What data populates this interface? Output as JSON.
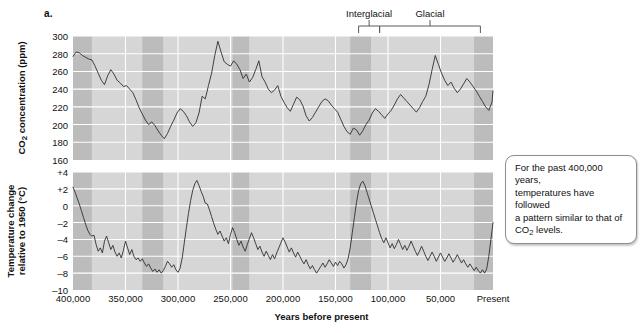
{
  "figure": {
    "panel_label": "a.",
    "xlabel": "Years before present",
    "callout": {
      "line1": "For the past 400,000 years,",
      "line2": "temperatures have followed",
      "line3": "a pattern similar to that of",
      "line4_pre": "CO",
      "line4_sub": "2",
      "line4_post": " levels."
    },
    "annotations": [
      {
        "label": "Interglacial",
        "x_start": 108000,
        "x_end": 128000
      },
      {
        "label": "Glacial",
        "x_start": 12000,
        "x_end": 108000
      }
    ],
    "colors": {
      "band_light": "#d6d6d6",
      "band_dark": "#bcbcbc",
      "gridline": "#ffffff",
      "curve": "#2f2f2f",
      "text": "#111111",
      "callout_border": "#8d8d8d"
    }
  },
  "chart_data": [
    {
      "type": "line",
      "name": "co2",
      "title": "",
      "xlabel": "Years before present",
      "ylabel": "CO2 concentration (ppm)",
      "ylabel_pre": "CO",
      "ylabel_sub": "2",
      "ylabel_post": " concentration (ppm)",
      "ylim": [
        160,
        300
      ],
      "yticks": [
        160,
        180,
        200,
        220,
        240,
        260,
        280,
        300
      ],
      "ytick_labels": [
        "160",
        "180",
        "200",
        "220",
        "240",
        "260",
        "280",
        "300"
      ],
      "xlim": [
        400000,
        0
      ],
      "xticks": [
        400000,
        350000,
        300000,
        250000,
        200000,
        150000,
        100000,
        50000,
        0
      ],
      "xtick_labels": [
        "400,000",
        "350,000",
        "300,000",
        "250,000",
        "200,000",
        "150,000",
        "100,000",
        "50,000",
        "Present"
      ],
      "grid": true,
      "legend": "none",
      "x": [
        400000,
        397000,
        394000,
        391000,
        388000,
        385000,
        382000,
        379000,
        376000,
        373000,
        370000,
        367000,
        364000,
        361000,
        358000,
        355000,
        352000,
        349000,
        346000,
        343000,
        340000,
        337000,
        334000,
        331000,
        328000,
        325000,
        322000,
        319000,
        316000,
        313000,
        310000,
        307000,
        304000,
        301000,
        298000,
        295000,
        292000,
        289000,
        286000,
        283000,
        280000,
        277000,
        274000,
        271000,
        268000,
        265000,
        262000,
        259000,
        256000,
        253000,
        250000,
        247000,
        244000,
        241000,
        238000,
        235000,
        232000,
        229000,
        226000,
        223000,
        220000,
        217000,
        214000,
        211000,
        208000,
        205000,
        202000,
        199000,
        196000,
        193000,
        190000,
        187000,
        184000,
        181000,
        178000,
        175000,
        172000,
        169000,
        166000,
        163000,
        160000,
        157000,
        154000,
        151000,
        148000,
        145000,
        142000,
        139000,
        136000,
        133000,
        130000,
        127000,
        124000,
        121000,
        118000,
        115000,
        112000,
        109000,
        106000,
        103000,
        100000,
        97000,
        94000,
        91000,
        88000,
        85000,
        82000,
        79000,
        76000,
        73000,
        70000,
        67000,
        64000,
        61000,
        58000,
        55000,
        52000,
        49000,
        46000,
        43000,
        40000,
        37000,
        34000,
        31000,
        28000,
        25000,
        22000,
        19000,
        16000,
        13000,
        10000,
        7000,
        4000,
        1000,
        0
      ],
      "y": [
        277,
        282,
        281,
        278,
        276,
        274,
        273,
        266,
        258,
        250,
        245,
        255,
        262,
        257,
        250,
        247,
        243,
        244,
        240,
        236,
        228,
        219,
        212,
        205,
        200,
        203,
        199,
        193,
        188,
        184,
        190,
        198,
        205,
        213,
        218,
        215,
        210,
        203,
        198,
        202,
        213,
        232,
        229,
        244,
        258,
        278,
        294,
        282,
        271,
        268,
        266,
        272,
        268,
        262,
        252,
        257,
        248,
        253,
        262,
        272,
        254,
        248,
        240,
        236,
        239,
        244,
        232,
        225,
        219,
        215,
        223,
        231,
        228,
        221,
        210,
        204,
        208,
        214,
        220,
        226,
        229,
        227,
        222,
        218,
        214,
        206,
        198,
        192,
        189,
        196,
        194,
        188,
        193,
        200,
        205,
        213,
        218,
        215,
        211,
        207,
        212,
        216,
        222,
        229,
        234,
        230,
        226,
        222,
        218,
        214,
        219,
        226,
        232,
        245,
        262,
        278,
        268,
        258,
        250,
        244,
        248,
        241,
        236,
        240,
        246,
        252,
        248,
        243,
        238,
        232,
        226,
        220,
        216,
        225,
        238,
        262,
        278,
        285,
        283
      ],
      "shaded_bands": [
        {
          "x_start": 400000,
          "x_end": 382000,
          "shade": "dark"
        },
        {
          "x_start": 382000,
          "x_end": 334000,
          "shade": "light"
        },
        {
          "x_start": 334000,
          "x_end": 314000,
          "shade": "dark"
        },
        {
          "x_start": 314000,
          "x_end": 248000,
          "shade": "light"
        },
        {
          "x_start": 248000,
          "x_end": 232000,
          "shade": "dark"
        },
        {
          "x_start": 232000,
          "x_end": 136000,
          "shade": "light"
        },
        {
          "x_start": 136000,
          "x_end": 116000,
          "shade": "dark"
        },
        {
          "x_start": 116000,
          "x_end": 18000,
          "shade": "light"
        },
        {
          "x_start": 18000,
          "x_end": 0,
          "shade": "dark"
        }
      ]
    },
    {
      "type": "line",
      "name": "temperature",
      "title": "",
      "xlabel": "Years before present",
      "ylabel": "Temperature change relative to 1950 (C)",
      "ylabel_line1": "Temperature change",
      "ylabel_line2": "relative to 1950 (°C)",
      "ylim": [
        -10,
        4
      ],
      "yticks": [
        -10,
        -8,
        -6,
        -4,
        -2,
        0,
        2,
        4
      ],
      "ytick_labels": [
        "–10",
        "–8",
        "–6",
        "–4",
        "–2",
        "0",
        "+2",
        "+4"
      ],
      "xlim": [
        400000,
        0
      ],
      "xticks": [
        400000,
        350000,
        300000,
        250000,
        200000,
        150000,
        100000,
        50000,
        0
      ],
      "xtick_labels": [
        "400,000",
        "350,000",
        "300,000",
        "250,000",
        "200,000",
        "150,000",
        "100,000",
        "50,000",
        "Present"
      ],
      "grid": true,
      "legend": "none",
      "x": [
        400000,
        398000,
        396000,
        394000,
        392000,
        390000,
        388000,
        386000,
        384000,
        382000,
        380000,
        378000,
        376000,
        374000,
        372000,
        370000,
        368000,
        366000,
        364000,
        362000,
        360000,
        358000,
        356000,
        354000,
        352000,
        350000,
        348000,
        346000,
        344000,
        342000,
        340000,
        338000,
        336000,
        334000,
        332000,
        330000,
        328000,
        326000,
        324000,
        322000,
        320000,
        318000,
        316000,
        314000,
        312000,
        310000,
        308000,
        306000,
        304000,
        302000,
        300000,
        298000,
        296000,
        294000,
        292000,
        290000,
        288000,
        286000,
        284000,
        282000,
        280000,
        278000,
        276000,
        274000,
        272000,
        270000,
        268000,
        266000,
        264000,
        262000,
        260000,
        258000,
        256000,
        254000,
        252000,
        250000,
        248000,
        246000,
        244000,
        242000,
        240000,
        238000,
        236000,
        234000,
        232000,
        230000,
        228000,
        226000,
        224000,
        222000,
        220000,
        218000,
        216000,
        214000,
        212000,
        210000,
        208000,
        206000,
        204000,
        202000,
        200000,
        198000,
        196000,
        194000,
        192000,
        190000,
        188000,
        186000,
        184000,
        182000,
        180000,
        178000,
        176000,
        174000,
        172000,
        170000,
        168000,
        166000,
        164000,
        162000,
        160000,
        158000,
        156000,
        154000,
        152000,
        150000,
        148000,
        146000,
        144000,
        142000,
        140000,
        138000,
        136000,
        134000,
        132000,
        130000,
        128000,
        126000,
        124000,
        122000,
        120000,
        118000,
        116000,
        114000,
        112000,
        110000,
        108000,
        106000,
        104000,
        102000,
        100000,
        98000,
        96000,
        94000,
        92000,
        90000,
        88000,
        86000,
        84000,
        82000,
        80000,
        78000,
        76000,
        74000,
        72000,
        70000,
        68000,
        66000,
        64000,
        62000,
        60000,
        58000,
        56000,
        54000,
        52000,
        50000,
        48000,
        46000,
        44000,
        42000,
        40000,
        38000,
        36000,
        34000,
        32000,
        30000,
        28000,
        26000,
        24000,
        22000,
        20000,
        18000,
        16000,
        14000,
        12000,
        10000,
        8000,
        6000,
        4000,
        2000,
        0
      ],
      "y": [
        2.2,
        1.6,
        0.9,
        0.2,
        -0.6,
        -1.4,
        -2.2,
        -2.9,
        -3.4,
        -3.6,
        -3.5,
        -4.6,
        -5.4,
        -5.0,
        -5.6,
        -4.2,
        -3.6,
        -4.4,
        -5.2,
        -4.7,
        -5.5,
        -6.0,
        -5.6,
        -6.2,
        -5.3,
        -4.2,
        -5.0,
        -5.8,
        -5.2,
        -6.0,
        -6.4,
        -6.2,
        -6.6,
        -6.3,
        -6.8,
        -7.2,
        -6.9,
        -7.4,
        -7.8,
        -7.5,
        -7.9,
        -7.6,
        -8.0,
        -7.7,
        -7.2,
        -6.6,
        -6.9,
        -7.3,
        -7.0,
        -7.6,
        -7.9,
        -7.4,
        -6.2,
        -4.4,
        -2.6,
        -0.9,
        0.6,
        1.8,
        2.6,
        3.0,
        2.4,
        1.7,
        1.1,
        0.3,
        0.2,
        -0.5,
        -1.3,
        -2.1,
        -2.8,
        -3.4,
        -3.0,
        -3.6,
        -4.2,
        -3.8,
        -4.5,
        -3.4,
        -2.6,
        -3.2,
        -4.0,
        -4.7,
        -4.2,
        -4.9,
        -5.4,
        -4.6,
        -3.9,
        -3.2,
        -3.8,
        -4.5,
        -5.2,
        -4.8,
        -5.5,
        -6.0,
        -5.4,
        -5.9,
        -6.4,
        -5.8,
        -6.3,
        -5.6,
        -5.0,
        -4.4,
        -3.8,
        -4.3,
        -4.9,
        -5.5,
        -5.0,
        -5.6,
        -6.1,
        -5.5,
        -6.0,
        -6.5,
        -6.9,
        -6.4,
        -7.0,
        -7.5,
        -7.1,
        -7.6,
        -8.0,
        -7.6,
        -7.2,
        -6.8,
        -7.3,
        -6.9,
        -6.4,
        -6.8,
        -7.2,
        -6.7,
        -7.1,
        -6.6,
        -6.9,
        -7.4,
        -7.0,
        -6.3,
        -5.0,
        -3.2,
        -1.4,
        0.4,
        1.8,
        2.6,
        2.9,
        2.4,
        1.6,
        0.8,
        0.0,
        -0.8,
        -1.6,
        -2.4,
        -3.2,
        -3.9,
        -4.4,
        -3.8,
        -4.4,
        -5.0,
        -4.5,
        -5.1,
        -4.6,
        -4.0,
        -4.6,
        -5.2,
        -4.7,
        -5.3,
        -4.8,
        -4.2,
        -4.8,
        -5.4,
        -5.9,
        -5.4,
        -4.8,
        -5.4,
        -6.0,
        -6.5,
        -6.0,
        -5.5,
        -6.0,
        -6.6,
        -6.1,
        -5.6,
        -6.1,
        -6.6,
        -6.2,
        -5.7,
        -6.2,
        -6.7,
        -6.3,
        -5.8,
        -6.3,
        -6.8,
        -6.4,
        -6.9,
        -7.3,
        -6.9,
        -7.3,
        -7.7,
        -7.3,
        -7.7,
        -8.0,
        -7.6,
        -8.0,
        -7.5,
        -6.0,
        -4.0,
        -2.0,
        -0.6,
        0.2,
        -0.4,
        0.6,
        -0.2,
        0.8,
        0.1,
        0.9,
        0.3,
        1.0
      ],
      "shaded_bands": [
        {
          "x_start": 400000,
          "x_end": 382000,
          "shade": "dark"
        },
        {
          "x_start": 382000,
          "x_end": 334000,
          "shade": "light"
        },
        {
          "x_start": 334000,
          "x_end": 314000,
          "shade": "dark"
        },
        {
          "x_start": 314000,
          "x_end": 248000,
          "shade": "light"
        },
        {
          "x_start": 248000,
          "x_end": 232000,
          "shade": "dark"
        },
        {
          "x_start": 232000,
          "x_end": 136000,
          "shade": "light"
        },
        {
          "x_start": 136000,
          "x_end": 116000,
          "shade": "dark"
        },
        {
          "x_start": 116000,
          "x_end": 18000,
          "shade": "light"
        },
        {
          "x_start": 18000,
          "x_end": 0,
          "shade": "dark"
        }
      ]
    }
  ]
}
